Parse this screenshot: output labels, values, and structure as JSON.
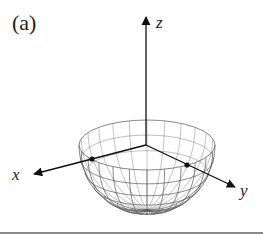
{
  "figure": {
    "panel_label": "(a)",
    "axes": {
      "x": {
        "label": "x"
      },
      "y": {
        "label": "y"
      },
      "z": {
        "label": "z"
      }
    },
    "surface": {
      "type": "hemisphere-wireframe",
      "meridians": 24,
      "parallels": 7,
      "stroke_color": "#555555"
    },
    "marked_points": [
      {
        "name": "point-on-x-axis",
        "on_axis": "x"
      },
      {
        "name": "point-on-y-axis",
        "on_axis": "y"
      }
    ],
    "colors": {
      "axis": "#111111",
      "mesh": "#555555",
      "rule": "#8a8a8a",
      "background": "#ffffff"
    }
  }
}
